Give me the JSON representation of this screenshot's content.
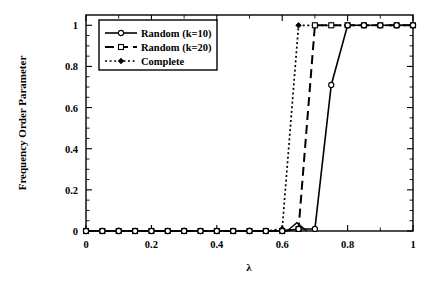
{
  "chart_data": {
    "type": "line",
    "title": "",
    "xlabel": "λ",
    "ylabel": "Frequency Order Parameter",
    "xlim": [
      0,
      1
    ],
    "ylim": [
      0,
      1.05
    ],
    "xticks": [
      0,
      0.2,
      0.4,
      0.6,
      0.8,
      1
    ],
    "xtick_labels": [
      "0",
      "0.2",
      "0.4",
      "0.6",
      "0.8",
      "1"
    ],
    "yticks": [
      0,
      0.2,
      0.4,
      0.6,
      0.8,
      1
    ],
    "ytick_labels": [
      "0",
      "0.2",
      "0.4",
      "0.6",
      "0.8",
      "1"
    ],
    "grid": false,
    "legend_position": "upper-left-inside",
    "x": [
      0,
      0.05,
      0.1,
      0.15,
      0.2,
      0.25,
      0.3,
      0.35,
      0.4,
      0.45,
      0.5,
      0.55,
      0.6,
      0.65,
      0.7,
      0.75,
      0.8,
      0.85,
      0.9,
      0.95,
      1
    ],
    "series": [
      {
        "name": "Random (k=10)",
        "linestyle": "solid",
        "marker": "open-circle",
        "values": [
          0,
          0,
          0,
          0,
          0,
          0,
          0,
          0,
          0,
          0,
          0,
          0,
          0,
          0.01,
          0.01,
          0.71,
          1,
          1,
          1,
          1,
          1
        ]
      },
      {
        "name": "Random (k=20)",
        "linestyle": "long-dash",
        "marker": "open-square",
        "values": [
          0,
          0,
          0,
          0,
          0,
          0,
          0,
          0,
          0,
          0,
          0,
          0,
          0,
          0.01,
          1,
          1,
          1,
          1,
          1,
          1,
          1
        ]
      },
      {
        "name": "Complete",
        "linestyle": "dotted",
        "marker": "filled-diamond",
        "values": [
          0,
          0,
          0,
          0,
          0,
          0,
          0,
          0,
          0,
          0,
          0,
          0,
          0.01,
          1,
          1,
          1,
          1,
          1,
          1,
          1,
          1
        ]
      }
    ],
    "annotations": [
      {
        "label": "small pre-transition bump",
        "x": 0.645,
        "y": 0.04
      }
    ],
    "colors": {
      "axis": "#000000",
      "series_1": "#000000",
      "series_2": "#000000",
      "series_3": "#000000",
      "background": "#ffffff"
    }
  },
  "legend": {
    "items": [
      {
        "label": "Random (k=10)"
      },
      {
        "label": "Random (k=20)"
      },
      {
        "label": "Complete"
      }
    ]
  }
}
